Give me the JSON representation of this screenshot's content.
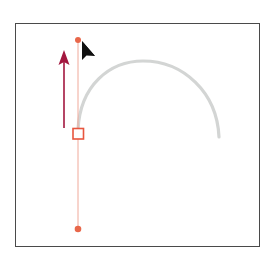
{
  "diagram": {
    "colors": {
      "frame": "#4a4a4a",
      "arc": "#d3d5d4",
      "handle_line": "#f0a99a",
      "handle_dot": "#e8674a",
      "anchor_stroke": "#e8563f",
      "drag_arrow": "#a3173f",
      "cursor": "#111111"
    },
    "elements": {
      "arc": {
        "start": [
          78,
          130
        ],
        "peak": [
          143,
          61
        ],
        "end": [
          219,
          137
        ]
      },
      "anchor_point": {
        "x": 78,
        "y": 134,
        "size": 11
      },
      "direction_handle_top": {
        "x": 78,
        "y": 40
      },
      "direction_handle_bottom": {
        "x": 78,
        "y": 229
      },
      "drag_arrow": {
        "x": 64,
        "from_y": 128,
        "to_y": 50
      },
      "cursor": {
        "x": 82,
        "y": 42,
        "type": "pen-selection-arrow"
      }
    }
  }
}
